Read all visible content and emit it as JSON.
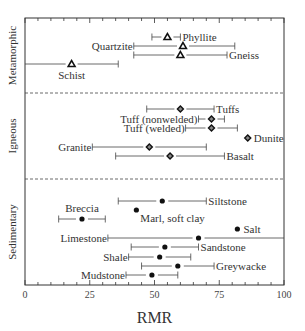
{
  "chart_data": {
    "type": "range-dot",
    "title": "",
    "xlabel": "RMR",
    "ylabel": "",
    "xlim": [
      0,
      100
    ],
    "xticks": [
      0,
      25,
      50,
      75,
      100
    ],
    "groups": [
      {
        "name": "Metamorphic",
        "marker": "triangle",
        "items": [
          {
            "rock": "Phyllite",
            "min": 49,
            "mean": 55,
            "max": 60
          },
          {
            "rock": "Quartzite",
            "min": 42,
            "mean": 61,
            "max": 81
          },
          {
            "rock": "Gneiss",
            "min": 42,
            "mean": 60,
            "max": 78
          },
          {
            "rock": "Schist",
            "min": 0,
            "mean": 18,
            "max": 36
          }
        ]
      },
      {
        "name": "Igneous",
        "marker": "diamond",
        "items": [
          {
            "rock": "Tuffs",
            "min": 47,
            "mean": 60,
            "max": 73
          },
          {
            "rock": "Tuff (nonwelded)",
            "min": 67,
            "mean": 72,
            "max": 77
          },
          {
            "rock": "Tuff (welded)",
            "min": 62,
            "mean": 72,
            "max": 82
          },
          {
            "rock": "Dunite",
            "min": null,
            "mean": 86,
            "max": null
          },
          {
            "rock": "Granite",
            "min": 26,
            "mean": 48,
            "max": 70
          },
          {
            "rock": "Basalt",
            "min": 35,
            "mean": 56,
            "max": 77
          }
        ]
      },
      {
        "name": "Sedimentary",
        "marker": "circle",
        "items": [
          {
            "rock": "Siltstone",
            "min": 36,
            "mean": 53,
            "max": 70
          },
          {
            "rock": "Marl, soft clay",
            "min": null,
            "mean": 43,
            "max": null
          },
          {
            "rock": "Breccia",
            "min": 13,
            "mean": 22,
            "max": 31
          },
          {
            "rock": "Salt",
            "min": null,
            "mean": 82,
            "max": null
          },
          {
            "rock": "Limestone",
            "min": 32,
            "mean": 67,
            "max": 100
          },
          {
            "rock": "Sandstone",
            "min": 41,
            "mean": 54,
            "max": 67
          },
          {
            "rock": "Shale",
            "min": 40,
            "mean": 52,
            "max": 64
          },
          {
            "rock": "Greywacke",
            "min": 45,
            "mean": 59,
            "max": 73
          },
          {
            "rock": "Mudstone",
            "min": 39,
            "mean": 49,
            "max": 59
          }
        ]
      }
    ]
  }
}
